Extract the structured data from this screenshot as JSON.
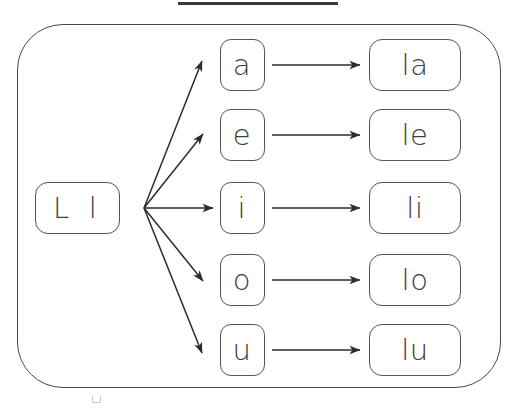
{
  "title": {
    "underline_only": true,
    "rule_color": "#3a3a3a"
  },
  "diagram": {
    "type": "syllable-fan-chart",
    "base": {
      "label": "L l",
      "uppercase": "L",
      "lowercase": "l"
    },
    "vowels": [
      {
        "label": "a"
      },
      {
        "label": "e"
      },
      {
        "label": "i"
      },
      {
        "label": "o"
      },
      {
        "label": "u"
      }
    ],
    "syllables": [
      {
        "label": "la"
      },
      {
        "label": "le"
      },
      {
        "label": "li"
      },
      {
        "label": "lo"
      },
      {
        "label": "lu"
      }
    ],
    "colors": {
      "stroke": "#555555",
      "arrow": "#2b2b2b",
      "card_border": "#4a4a4a",
      "text": "#3d3d3d",
      "background": "#ffffff"
    },
    "fan_origin": {
      "x": 144,
      "y": 208
    }
  }
}
